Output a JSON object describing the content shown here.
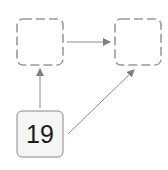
{
  "diagram": {
    "nodes": [
      {
        "id": "top-left",
        "label": "",
        "style": "dashed-empty"
      },
      {
        "id": "top-right",
        "label": "",
        "style": "dashed-empty"
      },
      {
        "id": "bottom",
        "label": "19",
        "style": "filled"
      }
    ],
    "edges": [
      {
        "from": "top-left",
        "to": "top-right"
      },
      {
        "from": "bottom",
        "to": "top-left"
      },
      {
        "from": "bottom",
        "to": "top-right"
      }
    ],
    "colors": {
      "dashed_border": "#9a9a9a",
      "filled_bg": "#f5f5f5",
      "filled_border": "#8a8a8a",
      "arrow": "#8c8c8c"
    }
  }
}
